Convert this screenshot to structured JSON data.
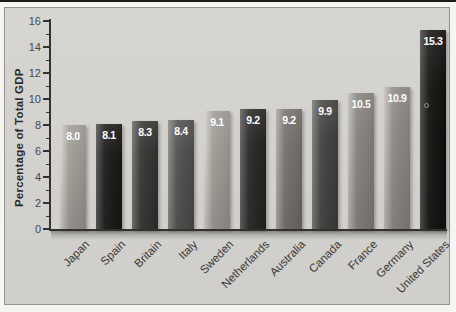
{
  "chart_data": {
    "type": "bar",
    "title": "",
    "xlabel": "",
    "ylabel": "Percentage of Total GDP",
    "ylim": [
      0,
      16
    ],
    "y_ticks": [
      0,
      2,
      4,
      6,
      8,
      10,
      12,
      14,
      16
    ],
    "y_minor_ticks": [
      1,
      3,
      5,
      7,
      9,
      11,
      13,
      15
    ],
    "grid": false,
    "legend": false,
    "categories": [
      "Japan",
      "Spain",
      "Britain",
      "Italy",
      "Sweden",
      "Netherlands",
      "Australia",
      "Canada",
      "France",
      "Germany",
      "United States"
    ],
    "values": [
      8.0,
      8.1,
      8.3,
      8.4,
      9.1,
      9.2,
      9.2,
      9.9,
      10.5,
      10.9,
      15.3
    ],
    "value_labels": [
      "8.0",
      "8.1",
      "8.3",
      "8.4",
      "9.1",
      "9.2",
      "9.2",
      "9.9",
      "10.5",
      "10.9",
      "15.3"
    ],
    "bar_colors": [
      "#a4a19b",
      "#262524",
      "#403e3d",
      "#5a5856",
      "#a3a09a",
      "#32312f",
      "#7b7873",
      "#4d4b49",
      "#8b8884",
      "#918e8a",
      "#201e1d"
    ],
    "colors": {
      "panel_bg": "#d3d2cf",
      "axis": "#34322f",
      "tick_label": "#4a4846",
      "category_label": "#3a3834",
      "value_label": "#ffffff",
      "y_title": "#2b2a28"
    }
  }
}
